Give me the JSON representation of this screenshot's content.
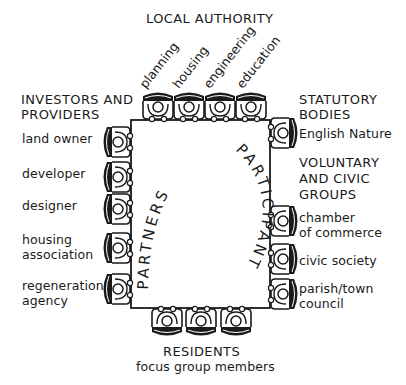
{
  "diagram": {
    "title": "LOCAL AUTHORITY",
    "table": {
      "text_left_arc": "PARTNERS",
      "text_right_arc": "PARTICIPANT"
    },
    "top": {
      "heading": "LOCAL AUTHORITY",
      "seats": [
        "planning",
        "housing",
        "engineering",
        "education"
      ]
    },
    "left": {
      "heading_line1": "INVESTORS AND",
      "heading_line2": "PROVIDERS",
      "seats": [
        {
          "line1": "land owner",
          "line2": ""
        },
        {
          "line1": "developer",
          "line2": ""
        },
        {
          "line1": "designer",
          "line2": ""
        },
        {
          "line1": "housing",
          "line2": "association"
        },
        {
          "line1": "regeneration",
          "line2": "agency"
        }
      ]
    },
    "right": {
      "group1_line1": "STATUTORY",
      "group1_line2": "BODIES",
      "group1_seats": [
        {
          "line1": "English Nature",
          "line2": ""
        }
      ],
      "group2_line1": "VOLUNTARY",
      "group2_line2": "AND CIVIC",
      "group2_line3": "GROUPS",
      "group2_seats": [
        {
          "line1": "chamber",
          "line2": "of commerce"
        },
        {
          "line1": "civic society",
          "line2": ""
        },
        {
          "line1": "parish/town",
          "line2": "council"
        }
      ]
    },
    "bottom": {
      "heading": "RESIDENTS",
      "subheading": "focus group members",
      "seat_count": 3
    },
    "colors": {
      "ink": "#1a1a1a",
      "background": "#ffffff"
    }
  }
}
